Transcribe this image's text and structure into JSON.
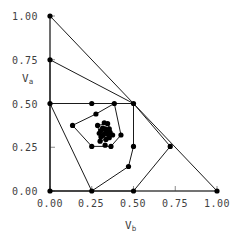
{
  "chart_data": {
    "type": "scatter",
    "title": "",
    "xlabel": "V_b",
    "ylabel": "V_a",
    "xlim": [
      0.0,
      1.0
    ],
    "ylim": [
      0.0,
      1.0
    ],
    "grid": false,
    "legend": "none",
    "xticks": [
      "0.00",
      "0.25",
      "0.50",
      "0.75",
      "1.00"
    ],
    "yticks": [
      "0.00",
      "0.25",
      "0.50",
      "0.75",
      "1.00"
    ],
    "xtick_values": [
      0.0,
      0.25,
      0.5,
      0.75,
      1.0
    ],
    "ytick_values": [
      0.0,
      0.25,
      0.5,
      0.75,
      1.0
    ],
    "marker": "filled-circle",
    "marker_color": "#000000",
    "line_color": "#1a1a1a",
    "axis_color": "#808080",
    "points": [
      {
        "x": 0.0,
        "y": 1.0
      },
      {
        "x": 0.0,
        "y": 0.75
      },
      {
        "x": 0.0,
        "y": 0.5
      },
      {
        "x": 0.0,
        "y": 0.0
      },
      {
        "x": 0.25,
        "y": 0.0
      },
      {
        "x": 0.5,
        "y": 0.0
      },
      {
        "x": 1.0,
        "y": 0.0
      },
      {
        "x": 0.72,
        "y": 0.255
      },
      {
        "x": 0.5,
        "y": 0.5
      },
      {
        "x": 0.5,
        "y": 0.255
      },
      {
        "x": 0.385,
        "y": 0.5
      },
      {
        "x": 0.25,
        "y": 0.5
      },
      {
        "x": 0.275,
        "y": 0.44
      },
      {
        "x": 0.135,
        "y": 0.375
      },
      {
        "x": 0.25,
        "y": 0.255
      },
      {
        "x": 0.47,
        "y": 0.14
      },
      {
        "x": 0.425,
        "y": 0.32
      },
      {
        "x": 0.285,
        "y": 0.375
      },
      {
        "x": 0.345,
        "y": 0.385
      },
      {
        "x": 0.325,
        "y": 0.39
      },
      {
        "x": 0.305,
        "y": 0.345
      },
      {
        "x": 0.315,
        "y": 0.36
      },
      {
        "x": 0.33,
        "y": 0.355
      },
      {
        "x": 0.34,
        "y": 0.345
      },
      {
        "x": 0.355,
        "y": 0.355
      },
      {
        "x": 0.36,
        "y": 0.335
      },
      {
        "x": 0.345,
        "y": 0.325
      },
      {
        "x": 0.33,
        "y": 0.33
      },
      {
        "x": 0.318,
        "y": 0.318
      },
      {
        "x": 0.305,
        "y": 0.31
      },
      {
        "x": 0.295,
        "y": 0.33
      },
      {
        "x": 0.355,
        "y": 0.305
      },
      {
        "x": 0.375,
        "y": 0.32
      },
      {
        "x": 0.335,
        "y": 0.295
      },
      {
        "x": 0.3,
        "y": 0.285
      },
      {
        "x": 0.365,
        "y": 0.255
      },
      {
        "x": 0.33,
        "y": 0.262
      }
    ],
    "hull_layers": [
      {
        "name": "hull-layer-1",
        "closed": true,
        "vertices": [
          {
            "x": 0.0,
            "y": 1.0
          },
          {
            "x": 1.0,
            "y": 0.0
          },
          {
            "x": 0.0,
            "y": 0.0
          }
        ]
      },
      {
        "name": "hull-layer-2",
        "closed": true,
        "vertices": [
          {
            "x": 0.0,
            "y": 0.75
          },
          {
            "x": 0.5,
            "y": 0.5
          },
          {
            "x": 0.72,
            "y": 0.255
          },
          {
            "x": 0.5,
            "y": 0.0
          },
          {
            "x": 0.25,
            "y": 0.0
          },
          {
            "x": 0.0,
            "y": 0.5
          }
        ]
      },
      {
        "name": "hull-layer-3",
        "closed": true,
        "vertices": [
          {
            "x": 0.0,
            "y": 0.5
          },
          {
            "x": 0.25,
            "y": 0.5
          },
          {
            "x": 0.385,
            "y": 0.5
          },
          {
            "x": 0.5,
            "y": 0.5
          },
          {
            "x": 0.5,
            "y": 0.255
          },
          {
            "x": 0.47,
            "y": 0.14
          },
          {
            "x": 0.25,
            "y": 0.0
          },
          {
            "x": 0.0,
            "y": 0.0
          }
        ]
      },
      {
        "name": "hull-layer-4",
        "closed": true,
        "vertices": [
          {
            "x": 0.275,
            "y": 0.44
          },
          {
            "x": 0.385,
            "y": 0.5
          },
          {
            "x": 0.425,
            "y": 0.32
          },
          {
            "x": 0.365,
            "y": 0.255
          },
          {
            "x": 0.25,
            "y": 0.255
          },
          {
            "x": 0.135,
            "y": 0.375
          }
        ]
      },
      {
        "name": "hull-layer-5",
        "closed": true,
        "vertices": [
          {
            "x": 0.285,
            "y": 0.375
          },
          {
            "x": 0.345,
            "y": 0.385
          },
          {
            "x": 0.375,
            "y": 0.32
          },
          {
            "x": 0.355,
            "y": 0.305
          },
          {
            "x": 0.3,
            "y": 0.285
          },
          {
            "x": 0.295,
            "y": 0.33
          }
        ]
      },
      {
        "name": "hull-layer-6",
        "closed": true,
        "vertices": [
          {
            "x": 0.315,
            "y": 0.36
          },
          {
            "x": 0.355,
            "y": 0.355
          },
          {
            "x": 0.36,
            "y": 0.335
          },
          {
            "x": 0.345,
            "y": 0.325
          },
          {
            "x": 0.318,
            "y": 0.318
          },
          {
            "x": 0.305,
            "y": 0.345
          }
        ]
      }
    ]
  },
  "axes": {
    "y_title_main": "V",
    "y_title_sub": "a",
    "x_title_main": "V",
    "x_title_sub": "b"
  }
}
